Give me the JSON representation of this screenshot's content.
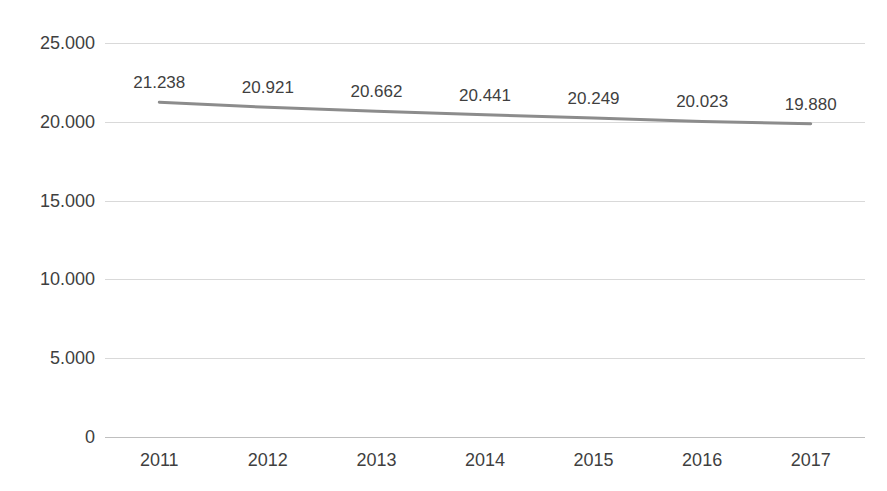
{
  "chart_data": {
    "type": "line",
    "title": "",
    "subtitle": "",
    "xlabel": "",
    "ylabel": "",
    "categories": [
      "2011",
      "2012",
      "2013",
      "2014",
      "2015",
      "2016",
      "2017"
    ],
    "values": [
      21238,
      20921,
      20662,
      20441,
      20249,
      20023,
      19880
    ],
    "value_labels": [
      "21.238",
      "20.921",
      "20.662",
      "20.441",
      "20.249",
      "20.023",
      "19.880"
    ],
    "series": [
      {
        "name": "",
        "values": [
          21238,
          20921,
          20662,
          20441,
          20249,
          20023,
          19880
        ],
        "color": "#8c8c8c",
        "line_width": 3,
        "markers": false
      }
    ],
    "ylim": [
      0,
      25000
    ],
    "ytick_values": [
      25000,
      20000,
      15000,
      10000,
      5000,
      0
    ],
    "ytick_labels": [
      "25.000",
      "20.000",
      "15.000",
      "10.000",
      "5.000",
      "0"
    ],
    "grid": true,
    "grid_axis": "y",
    "grid_color": "#d9d9d9",
    "legend": false,
    "legend_position": "none",
    "data_labels_shown": true,
    "background": "#ffffff",
    "axis_line_color": "#bfbfbf",
    "tick_label_color": "#3f3f3f",
    "title_color": "#a03a2e",
    "note": "Chart title is cropped above the top edge of the screenshot and is not legible."
  }
}
